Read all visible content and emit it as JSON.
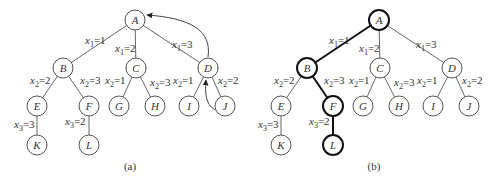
{
  "diagrams": [
    {
      "id": "a",
      "caption": "(a)",
      "nodes": [
        {
          "id": "A",
          "label": "A"
        },
        {
          "id": "B",
          "label": "B"
        },
        {
          "id": "C",
          "label": "C"
        },
        {
          "id": "D",
          "label": "D"
        },
        {
          "id": "E",
          "label": "E"
        },
        {
          "id": "F",
          "label": "F"
        },
        {
          "id": "G",
          "label": "G"
        },
        {
          "id": "H",
          "label": "H"
        },
        {
          "id": "I",
          "label": "I"
        },
        {
          "id": "J",
          "label": "J"
        },
        {
          "id": "K",
          "label": "K"
        },
        {
          "id": "L",
          "label": "L"
        }
      ],
      "edges": [
        {
          "from": "A",
          "to": "B",
          "var": "x",
          "sub": "1",
          "val": "=1"
        },
        {
          "from": "A",
          "to": "C",
          "var": "x",
          "sub": "1",
          "val": "=2"
        },
        {
          "from": "A",
          "to": "D",
          "var": "x",
          "sub": "1",
          "val": "=3"
        },
        {
          "from": "B",
          "to": "E",
          "var": "x",
          "sub": "2",
          "val": "=2"
        },
        {
          "from": "B",
          "to": "F",
          "var": "x",
          "sub": "2",
          "val": "=3"
        },
        {
          "from": "C",
          "to": "G",
          "var": "x",
          "sub": "2",
          "val": "=1"
        },
        {
          "from": "C",
          "to": "H",
          "var": "x",
          "sub": "2",
          "val": "=3"
        },
        {
          "from": "D",
          "to": "I",
          "var": "x",
          "sub": "2",
          "val": "=1"
        },
        {
          "from": "D",
          "to": "J",
          "var": "x",
          "sub": "2",
          "val": "=2"
        },
        {
          "from": "E",
          "to": "K",
          "var": "x",
          "sub": "3",
          "val": "=3"
        },
        {
          "from": "F",
          "to": "L",
          "var": "x",
          "sub": "3",
          "val": "=2"
        }
      ],
      "backtrack_arrows": [
        {
          "from": "D",
          "to": "A"
        },
        {
          "from": "J",
          "to": "D"
        }
      ]
    },
    {
      "id": "b",
      "caption": "(b)",
      "highlighted_path": [
        "A",
        "B",
        "F",
        "L"
      ]
    }
  ]
}
